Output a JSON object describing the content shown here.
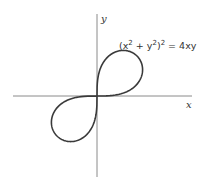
{
  "diagram": {
    "equation": "(x² + y²)² = 4xy",
    "equation_parts": {
      "open": "(x",
      "exp1": "2",
      "plus": " + y",
      "exp2": "2",
      "close": ")",
      "exp3": "2",
      "rhs": " = 4xy"
    },
    "x_axis_label": "x",
    "y_axis_label": "y",
    "curve_name": "lemniscate",
    "colors": {
      "axis": "#8a8a8a",
      "curve": "#3a3a3a",
      "text": "#333333"
    }
  }
}
